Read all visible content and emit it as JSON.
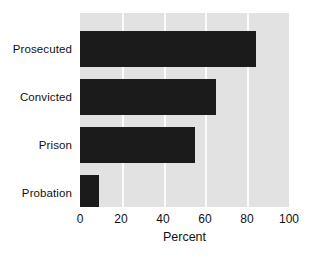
{
  "chart_data": {
    "type": "bar",
    "orientation": "horizontal",
    "title": "",
    "subtitle": "",
    "categories": [
      "Prosecuted",
      "Convicted",
      "Prison",
      "Probation"
    ],
    "values": [
      84,
      65,
      55,
      9
    ],
    "series": [
      {
        "name": "Percent",
        "values": [
          84,
          65,
          55,
          9
        ]
      }
    ],
    "xlabel": "Percent",
    "ylabel": "",
    "xlim": [
      0,
      100
    ],
    "xticks": [
      0,
      20,
      40,
      60,
      80,
      100
    ],
    "xtick_labels": [
      "0",
      "20",
      "40",
      "60",
      "80",
      "100"
    ],
    "grid": "vertical",
    "gridline_values": [
      20,
      40,
      60,
      80
    ],
    "legend": "none",
    "legend_position": "none",
    "annotations": [],
    "colors": {
      "bar": "#1b1b1b",
      "plot_background": "#e2e2e2",
      "gridline": "#fbfbfb",
      "page_background": "#ffffff",
      "text": "#111111"
    }
  }
}
